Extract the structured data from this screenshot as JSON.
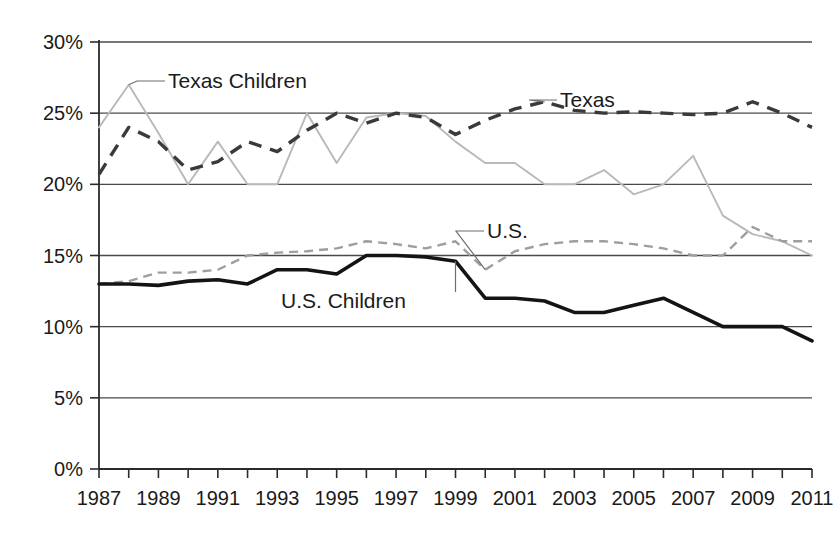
{
  "chart_data": {
    "type": "line",
    "title": "",
    "subtitle": "",
    "xlabel": "",
    "ylabel": "",
    "xlim": [
      1987,
      2011
    ],
    "ylim": [
      0,
      30
    ],
    "y_tick_labels": [
      "30%",
      "25%",
      "20%",
      "15%",
      "10%",
      "5%",
      "0%"
    ],
    "y_tick_values": [
      30,
      25,
      20,
      15,
      10,
      5,
      0
    ],
    "x_tick_labels": [
      "1987",
      "1989",
      "1991",
      "1993",
      "1995",
      "1997",
      "1999",
      "2001",
      "2003",
      "2005",
      "2007",
      "2009",
      "2011"
    ],
    "x_tick_values": [
      1987,
      1989,
      1991,
      1993,
      1995,
      1997,
      1999,
      2001,
      2003,
      2005,
      2007,
      2009,
      2011
    ],
    "x_minor_ticks": [
      1987,
      1988,
      1989,
      1990,
      1991,
      1992,
      1993,
      1994,
      1995,
      1996,
      1997,
      1998,
      1999,
      2000,
      2001,
      2002,
      2003,
      2004,
      2005,
      2006,
      2007,
      2008,
      2009,
      2010,
      2011
    ],
    "grid": "horizontal",
    "legend_position": "inline-annotations",
    "x": [
      1987,
      1988,
      1989,
      1990,
      1991,
      1992,
      1993,
      1994,
      1995,
      1996,
      1997,
      1998,
      1999,
      2000,
      2001,
      2002,
      2003,
      2004,
      2005,
      2006,
      2007,
      2008,
      2009,
      2010,
      2011
    ],
    "series": [
      {
        "name": "Texas Children",
        "style": "solid-light-gray",
        "color": "#b9b9b9",
        "values": [
          24.0,
          27.0,
          23.6,
          20.0,
          23.0,
          20.0,
          20.0,
          25.0,
          21.5,
          24.7,
          25.0,
          24.8,
          23.0,
          21.5,
          21.5,
          20.0,
          20.0,
          21.0,
          19.3,
          20.0,
          22.0,
          17.8,
          16.5,
          16.0,
          15.0
        ]
      },
      {
        "name": "Texas",
        "style": "dashed-dark",
        "color": "#3a3a3a",
        "values": [
          20.7,
          24.0,
          23.0,
          21.0,
          21.6,
          23.0,
          22.3,
          23.8,
          25.0,
          24.3,
          25.0,
          24.7,
          23.5,
          24.5,
          25.3,
          25.8,
          25.2,
          25.0,
          25.1,
          25.0,
          24.9,
          25.0,
          25.8,
          25.0,
          24.0
        ]
      },
      {
        "name": "U.S.",
        "style": "dashed-light-gray",
        "color": "#9e9e9e",
        "values": [
          13.0,
          13.2,
          13.8,
          13.8,
          14.0,
          15.0,
          15.2,
          15.3,
          15.5,
          16.0,
          15.8,
          15.5,
          16.0,
          14.0,
          15.3,
          15.8,
          16.0,
          16.0,
          15.8,
          15.5,
          15.0,
          15.0,
          17.0,
          16.0,
          16.0
        ]
      },
      {
        "name": "U.S. Children",
        "style": "solid-black",
        "color": "#141414",
        "values": [
          13.0,
          13.0,
          12.9,
          13.2,
          13.3,
          13.0,
          14.0,
          14.0,
          13.7,
          15.0,
          15.0,
          14.9,
          14.6,
          12.0,
          12.0,
          11.8,
          11.0,
          11.0,
          11.5,
          12.0,
          11.0,
          10.0,
          10.0,
          10.0,
          9.0
        ]
      }
    ],
    "annotations": [
      {
        "text": "Texas Children",
        "series": "Texas Children",
        "anchor_year": 1988,
        "anchor_value": 27.0
      },
      {
        "text": "Texas",
        "series": "Texas",
        "anchor_year": 2002,
        "anchor_value": 25.8
      },
      {
        "text": "U.S.",
        "series": "U.S.",
        "anchor_year": 2000,
        "anchor_value": 14.0
      },
      {
        "text": "U.S. Children",
        "series": "U.S. Children",
        "anchor_year": 1999,
        "anchor_value": 14.6
      }
    ]
  },
  "colors": {
    "background": "#ffffff",
    "axis": "#2b2b2b",
    "grid": "#4a4a4a",
    "texas_children": "#b9b9b9",
    "texas": "#3a3a3a",
    "us": "#9e9e9e",
    "us_children": "#141414"
  }
}
